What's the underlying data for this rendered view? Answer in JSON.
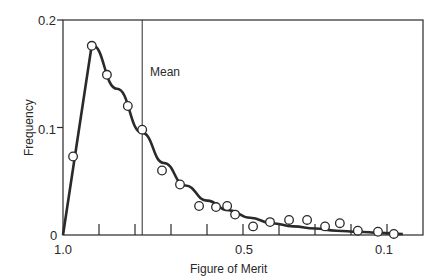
{
  "chart_data": {
    "type": "line",
    "title": "",
    "xlabel": "Figure of Merit",
    "ylabel": "Frequency",
    "xlim": [
      1.0,
      0.0
    ],
    "ylim": [
      0,
      0.2
    ],
    "x_reversed": true,
    "grid": false,
    "legend": null,
    "x_tick_labels": [
      {
        "value": 1.0,
        "label": "1.0"
      },
      {
        "value": 0.5,
        "label": "0.5"
      },
      {
        "value": 0.1,
        "label": "0.1"
      }
    ],
    "x_minor_ticks": [
      0.9,
      0.8,
      0.7,
      0.6,
      0.4,
      0.3,
      0.2
    ],
    "y_tick_labels": [
      {
        "value": 0,
        "label": "0"
      },
      {
        "value": 0.1,
        "label": "0.1"
      },
      {
        "value": 0.2,
        "label": "0.2"
      }
    ],
    "annotations": [
      {
        "type": "vertical-line",
        "x": 0.78,
        "label": "Mean"
      }
    ],
    "series": [
      {
        "name": "observed",
        "style": "open-circle-markers",
        "points": [
          {
            "x": 0.972,
            "y": 0.073
          },
          {
            "x": 0.92,
            "y": 0.176
          },
          {
            "x": 0.878,
            "y": 0.149
          },
          {
            "x": 0.82,
            "y": 0.12
          },
          {
            "x": 0.78,
            "y": 0.098
          },
          {
            "x": 0.725,
            "y": 0.06
          },
          {
            "x": 0.675,
            "y": 0.047
          },
          {
            "x": 0.622,
            "y": 0.027
          },
          {
            "x": 0.575,
            "y": 0.026
          },
          {
            "x": 0.544,
            "y": 0.027
          },
          {
            "x": 0.522,
            "y": 0.019
          },
          {
            "x": 0.472,
            "y": 0.008
          },
          {
            "x": 0.425,
            "y": 0.012
          },
          {
            "x": 0.372,
            "y": 0.014
          },
          {
            "x": 0.322,
            "y": 0.014
          },
          {
            "x": 0.272,
            "y": 0.008
          },
          {
            "x": 0.231,
            "y": 0.011
          },
          {
            "x": 0.181,
            "y": 0.004
          },
          {
            "x": 0.125,
            "y": 0.003
          },
          {
            "x": 0.081,
            "y": 0.001
          }
        ]
      },
      {
        "name": "fitted-curve",
        "style": "thick-solid-line",
        "points": [
          {
            "x": 1.0,
            "y": 0.0
          },
          {
            "x": 0.92,
            "y": 0.177
          },
          {
            "x": 0.85,
            "y": 0.136
          },
          {
            "x": 0.78,
            "y": 0.095
          },
          {
            "x": 0.72,
            "y": 0.067
          },
          {
            "x": 0.66,
            "y": 0.046
          },
          {
            "x": 0.6,
            "y": 0.032
          },
          {
            "x": 0.54,
            "y": 0.023
          },
          {
            "x": 0.48,
            "y": 0.016
          },
          {
            "x": 0.42,
            "y": 0.011
          },
          {
            "x": 0.36,
            "y": 0.008
          },
          {
            "x": 0.3,
            "y": 0.006
          },
          {
            "x": 0.24,
            "y": 0.004
          },
          {
            "x": 0.18,
            "y": 0.003
          },
          {
            "x": 0.12,
            "y": 0.002
          },
          {
            "x": 0.056,
            "y": 0.001
          }
        ]
      }
    ]
  },
  "labels": {
    "xlabel": "Figure of Merit",
    "ylabel": "Frequency",
    "mean": "Mean",
    "x_ticks": [
      "1.0",
      "0.5",
      "0.1"
    ],
    "y_ticks": [
      "0",
      "0.1",
      "0.2"
    ]
  },
  "colors": {
    "ink": "#2a2a2a",
    "frame": "#3a3a3a",
    "background": "#ffffff"
  }
}
